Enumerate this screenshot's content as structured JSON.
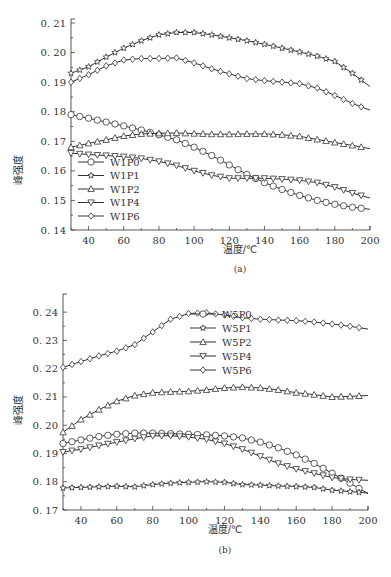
{
  "chart_data": [
    {
      "id": "a",
      "type": "line",
      "caption": "(a)",
      "title": "",
      "xlabel": "温度/℃",
      "ylabel": "峰强度",
      "xlim": [
        30,
        200
      ],
      "ylim": [
        0.14,
        0.21
      ],
      "xticks": [
        40,
        60,
        80,
        100,
        120,
        140,
        160,
        180,
        200
      ],
      "yticks": [
        0.14,
        0.15,
        0.16,
        0.17,
        0.18,
        0.19,
        0.2,
        0.21
      ],
      "ytick_labels": [
        "0.14",
        "0.15",
        "0.16",
        "0.17",
        "0.18",
        "0.19",
        "0.20",
        "0.21"
      ],
      "grid": false,
      "legend_position": "lower-left",
      "x": [
        30,
        40,
        50,
        60,
        70,
        80,
        90,
        100,
        110,
        120,
        130,
        140,
        150,
        160,
        170,
        180,
        190,
        200
      ],
      "series": [
        {
          "name": "W1P0",
          "marker": "circle",
          "values": [
            0.179,
            0.1778,
            0.1765,
            0.1752,
            0.1738,
            0.1722,
            0.1705,
            0.168,
            0.1652,
            0.162,
            0.1588,
            0.156,
            0.1537,
            0.1517,
            0.15,
            0.1487,
            0.1477,
            0.147
          ]
        },
        {
          "name": "W1P1",
          "marker": "star",
          "values": [
            0.193,
            0.1952,
            0.1985,
            0.2015,
            0.204,
            0.206,
            0.2068,
            0.2068,
            0.206,
            0.205,
            0.204,
            0.2028,
            0.2015,
            0.2002,
            0.1988,
            0.197,
            0.193,
            0.1885
          ]
        },
        {
          "name": "W1P2",
          "marker": "triangle-up",
          "values": [
            0.168,
            0.1693,
            0.1705,
            0.1718,
            0.1725,
            0.1727,
            0.1728,
            0.1726,
            0.1724,
            0.1724,
            0.1725,
            0.1725,
            0.1722,
            0.1717,
            0.1706,
            0.1696,
            0.1686,
            0.1675
          ]
        },
        {
          "name": "W1P4",
          "marker": "triangle-down",
          "values": [
            0.166,
            0.1655,
            0.1652,
            0.1648,
            0.1642,
            0.1632,
            0.1618,
            0.16,
            0.1585,
            0.1575,
            0.1575,
            0.1575,
            0.1572,
            0.1568,
            0.156,
            0.1545,
            0.1525,
            0.1508
          ]
        },
        {
          "name": "W1P6",
          "marker": "diamond",
          "values": [
            0.19,
            0.1925,
            0.1955,
            0.1975,
            0.198,
            0.198,
            0.1982,
            0.1965,
            0.1945,
            0.1928,
            0.1912,
            0.1905,
            0.19,
            0.1895,
            0.188,
            0.1855,
            0.1828,
            0.1805
          ]
        }
      ]
    },
    {
      "id": "b",
      "type": "line",
      "caption": "(b)",
      "title": "",
      "xlabel": "温度/℃",
      "ylabel": "峰强度",
      "xlim": [
        30,
        200
      ],
      "ylim": [
        0.17,
        0.245
      ],
      "xticks": [
        40,
        60,
        80,
        100,
        120,
        140,
        160,
        180,
        200
      ],
      "yticks": [
        0.17,
        0.18,
        0.19,
        0.2,
        0.21,
        0.22,
        0.23,
        0.24
      ],
      "ytick_labels": [
        "0.17",
        "0.18",
        "0.19",
        "0.20",
        "0.21",
        "0.22",
        "0.23",
        "0.24"
      ],
      "grid": false,
      "legend_position": "upper-center",
      "x": [
        30,
        40,
        50,
        60,
        70,
        80,
        90,
        100,
        110,
        120,
        130,
        140,
        150,
        160,
        170,
        180,
        190,
        200
      ],
      "series": [
        {
          "name": "W5P0",
          "marker": "circle",
          "values": [
            0.1935,
            0.1948,
            0.196,
            0.1968,
            0.1972,
            0.1972,
            0.197,
            0.1968,
            0.1966,
            0.1962,
            0.1955,
            0.194,
            0.192,
            0.1895,
            0.1865,
            0.183,
            0.1795,
            0.1758
          ]
        },
        {
          "name": "W5P1",
          "marker": "star",
          "values": [
            0.1778,
            0.178,
            0.1782,
            0.1784,
            0.1782,
            0.179,
            0.1795,
            0.1798,
            0.18,
            0.1798,
            0.179,
            0.1788,
            0.1785,
            0.1783,
            0.178,
            0.177,
            0.1765,
            0.176
          ]
        },
        {
          "name": "W5P2",
          "marker": "triangle-up",
          "values": [
            0.1975,
            0.202,
            0.2055,
            0.2085,
            0.2105,
            0.2115,
            0.2118,
            0.212,
            0.2125,
            0.2132,
            0.2135,
            0.2132,
            0.2125,
            0.2115,
            0.2108,
            0.21,
            0.2102,
            0.2105
          ]
        },
        {
          "name": "W5P4",
          "marker": "triangle-down",
          "values": [
            0.1905,
            0.1915,
            0.1928,
            0.194,
            0.1952,
            0.1962,
            0.1963,
            0.1958,
            0.195,
            0.1935,
            0.1915,
            0.189,
            0.1865,
            0.1845,
            0.183,
            0.1815,
            0.1808,
            0.1805
          ]
        },
        {
          "name": "W5P6",
          "marker": "diamond",
          "values": [
            0.2205,
            0.2225,
            0.2245,
            0.2262,
            0.2285,
            0.233,
            0.2375,
            0.2395,
            0.2398,
            0.239,
            0.238,
            0.2375,
            0.2372,
            0.237,
            0.2365,
            0.2358,
            0.235,
            0.234
          ]
        }
      ]
    }
  ],
  "charts_layout": {
    "a": {
      "left": 71,
      "right": 370,
      "top": 23,
      "bottom": 230,
      "ylabel_x": 22,
      "ylabel_y": 170,
      "xlabel_x": 240,
      "xlabel_y": 253,
      "caption_x": 240,
      "caption_y": 272,
      "legend": {
        "x": 78,
        "y": 162,
        "dy": 13.5
      }
    },
    "b": {
      "left": 63,
      "right": 368,
      "top": 8,
      "bottom": 220,
      "ylabel_x": 22,
      "ylabel_y": 120,
      "xlabel_x": 225,
      "xlabel_y": 243,
      "caption_x": 225,
      "caption_y": 263,
      "legend": {
        "x": 190,
        "y": 24,
        "dy": 14
      }
    }
  }
}
